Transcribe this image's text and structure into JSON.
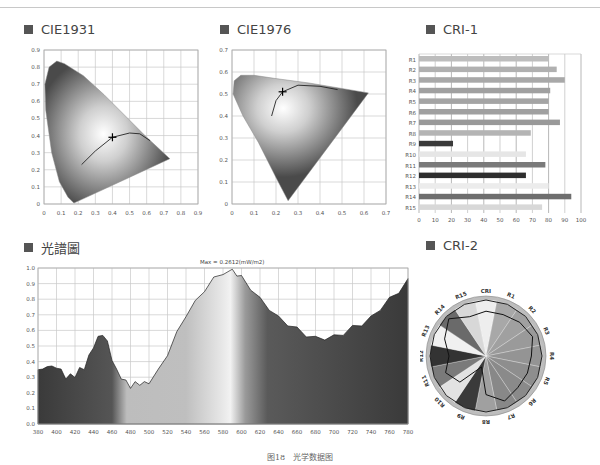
{
  "titles": {
    "cie1931": "CIE1931",
    "cie1976": "CIE1976",
    "cri1": "CRI-1",
    "spectrum": "光譜圖",
    "cri2": "CRI-2"
  },
  "caption": "图18　光学数据图",
  "spectrum_max_label": "Max = 0.2612(mW/m2)",
  "colors": {
    "title_square": "#555555",
    "grid": "#c8c8c8",
    "curve": "#222222"
  },
  "chart_data": [
    {
      "id": "cie1931",
      "type": "scatter",
      "title": "CIE1931",
      "xlabel": "x",
      "ylabel": "y",
      "xlim": [
        0,
        0.9
      ],
      "ylim": [
        0,
        0.9
      ],
      "xticks": [
        "0",
        "0.1",
        "0.2",
        "0.3",
        "0.4",
        "0.5",
        "0.6",
        "0.7",
        "0.8",
        "0.9"
      ],
      "yticks": [
        "0",
        "0.1",
        "0.2",
        "0.3",
        "0.4",
        "0.5",
        "0.6",
        "0.7",
        "0.8",
        "0.9"
      ],
      "grid": true,
      "point": {
        "x": 0.4,
        "y": 0.39
      },
      "planckian_locus": [
        [
          0.22,
          0.23
        ],
        [
          0.3,
          0.31
        ],
        [
          0.4,
          0.39
        ],
        [
          0.5,
          0.415
        ],
        [
          0.56,
          0.41
        ],
        [
          0.62,
          0.37
        ]
      ]
    },
    {
      "id": "cie1976",
      "type": "scatter",
      "title": "CIE1976",
      "xlabel": "u'",
      "ylabel": "v'",
      "xlim": [
        0,
        0.7
      ],
      "ylim": [
        0,
        0.7
      ],
      "xticks": [
        "0",
        "0.1",
        "0.2",
        "0.3",
        "0.4",
        "0.5",
        "0.6",
        "0.7"
      ],
      "yticks": [
        "0",
        "0.1",
        "0.2",
        "0.3",
        "0.4",
        "0.5",
        "0.6",
        "0.7"
      ],
      "grid": true,
      "point": {
        "x": 0.23,
        "y": 0.51
      },
      "planckian_locus": [
        [
          0.18,
          0.4
        ],
        [
          0.2,
          0.47
        ],
        [
          0.23,
          0.51
        ],
        [
          0.3,
          0.54
        ],
        [
          0.4,
          0.535
        ],
        [
          0.48,
          0.52
        ]
      ]
    },
    {
      "id": "cri1",
      "type": "bar",
      "orientation": "horizontal",
      "title": "CRI-1",
      "categories": [
        "R1",
        "R2",
        "R3",
        "R4",
        "R5",
        "R6",
        "R7",
        "R8",
        "R9",
        "R10",
        "R11",
        "R12",
        "R13",
        "R14",
        "R15"
      ],
      "values": [
        80,
        85,
        90,
        81,
        80,
        80,
        87,
        69,
        21,
        66,
        78,
        66,
        80,
        94,
        76
      ],
      "bar_colors": [
        "#bdbdbd",
        "#b0b0b0",
        "#a8a8a8",
        "#a0a0a0",
        "#a4a4a4",
        "#a0a0a0",
        "#999999",
        "#b4b4b4",
        "#3a3a3a",
        "#e6e6e6",
        "#7a7a7a",
        "#2e2e2e",
        "#ececec",
        "#6e6e6e",
        "#d8d8d8"
      ],
      "xlim": [
        0,
        100
      ],
      "xticks": [
        "0",
        "10",
        "20",
        "30",
        "40",
        "50",
        "60",
        "70",
        "80",
        "90",
        "100"
      ],
      "grid": true
    },
    {
      "id": "spectrum",
      "type": "area",
      "title": "光譜圖",
      "annotation": "Max = 0.2612(mW/m2)",
      "xlabel": "Wavelength (nm)",
      "ylabel": "Relative intensity",
      "xlim": [
        380,
        780
      ],
      "ylim": [
        0,
        1.0
      ],
      "xticks": [
        "380",
        "400",
        "420",
        "440",
        "460",
        "480",
        "500",
        "520",
        "540",
        "560",
        "580",
        "600",
        "620",
        "640",
        "660",
        "680",
        "700",
        "720",
        "740",
        "760",
        "780"
      ],
      "yticks": [
        "0.0",
        "0.1",
        "0.2",
        "0.3",
        "0.4",
        "0.5",
        "0.6",
        "0.7",
        "0.8",
        "0.9",
        "1.0"
      ],
      "grid": true,
      "x": [
        380,
        385,
        390,
        395,
        400,
        405,
        410,
        415,
        420,
        425,
        430,
        435,
        440,
        445,
        450,
        455,
        460,
        465,
        470,
        475,
        480,
        485,
        490,
        495,
        500,
        510,
        520,
        530,
        540,
        550,
        560,
        570,
        580,
        590,
        595,
        600,
        610,
        620,
        630,
        640,
        650,
        660,
        670,
        680,
        690,
        700,
        710,
        720,
        730,
        740,
        750,
        760,
        770,
        780
      ],
      "values": [
        0.36,
        0.34,
        0.38,
        0.36,
        0.37,
        0.34,
        0.3,
        0.31,
        0.31,
        0.35,
        0.36,
        0.43,
        0.5,
        0.55,
        0.58,
        0.52,
        0.42,
        0.34,
        0.3,
        0.27,
        0.24,
        0.26,
        0.26,
        0.26,
        0.27,
        0.34,
        0.45,
        0.58,
        0.7,
        0.78,
        0.86,
        0.93,
        0.97,
        0.98,
        0.96,
        0.94,
        0.87,
        0.8,
        0.74,
        0.68,
        0.64,
        0.61,
        0.57,
        0.55,
        0.55,
        0.56,
        0.58,
        0.62,
        0.64,
        0.68,
        0.74,
        0.8,
        0.85,
        0.92
      ]
    },
    {
      "id": "cri2",
      "type": "radar",
      "title": "CRI-2",
      "categories": [
        "CRI",
        "R1",
        "R2",
        "R3",
        "R4",
        "R5",
        "R6",
        "R7",
        "R8",
        "R9",
        "R10",
        "R11",
        "R12",
        "R13",
        "R14",
        "R15"
      ],
      "values": [
        80,
        80,
        85,
        90,
        81,
        80,
        80,
        87,
        69,
        21,
        66,
        78,
        66,
        80,
        94,
        76
      ],
      "reference_ring": 100
    }
  ]
}
